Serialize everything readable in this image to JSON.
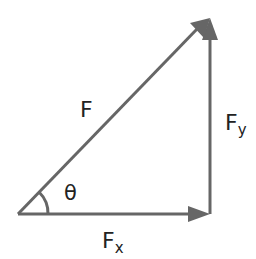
{
  "diagram": {
    "type": "vector-decomposition-right-triangle",
    "stroke_color": "#666666",
    "label_color": "#222222",
    "labels": {
      "resultant": "F",
      "vertical_component_main": "F",
      "vertical_component_sub": "y",
      "horizontal_component_main": "F",
      "horizontal_component_sub": "x",
      "angle": "θ"
    },
    "points": {
      "origin": [
        18,
        214
      ],
      "right_corner": [
        210,
        214
      ],
      "top_corner": [
        210,
        18
      ]
    }
  }
}
